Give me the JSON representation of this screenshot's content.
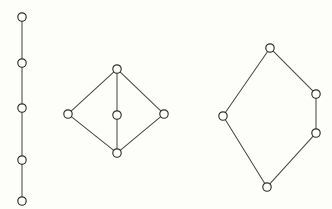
{
  "image": {
    "title": "Three Hasse diagrams of partially ordered sets",
    "background_color": "#fdfdf9",
    "node_fill_color": "#fdfdf9",
    "node_stroke_color": "#2e2e2e",
    "edge_color": "#4a4a4a",
    "width": 332,
    "height": 209,
    "node_radius": 4.2
  },
  "chart_data": {
    "type": "diagram",
    "title": "Three Hasse diagrams of partially ordered sets",
    "xlabel": "",
    "ylabel": "",
    "graphs": [
      {
        "name": "chain-5",
        "label": "Five element chain",
        "nodes": [
          {
            "id": "c1",
            "x": 22,
            "y": 17
          },
          {
            "id": "c2",
            "x": 22,
            "y": 63
          },
          {
            "id": "c3",
            "x": 22,
            "y": 108
          },
          {
            "id": "c4",
            "x": 22,
            "y": 160
          },
          {
            "id": "c5",
            "x": 22,
            "y": 201
          }
        ],
        "edges": [
          {
            "from": "c1",
            "to": "c2"
          },
          {
            "from": "c2",
            "to": "c3"
          },
          {
            "from": "c3",
            "to": "c4"
          },
          {
            "from": "c4",
            "to": "c5"
          }
        ]
      },
      {
        "name": "diamond-m3",
        "label": "Diamond lattice with three atoms",
        "nodes": [
          {
            "id": "d-top",
            "x": 117,
            "y": 69
          },
          {
            "id": "d-left",
            "x": 68,
            "y": 114
          },
          {
            "id": "d-center",
            "x": 117,
            "y": 115
          },
          {
            "id": "d-right",
            "x": 164,
            "y": 114
          },
          {
            "id": "d-bottom",
            "x": 117,
            "y": 153
          }
        ],
        "edges": [
          {
            "from": "d-top",
            "to": "d-left"
          },
          {
            "from": "d-top",
            "to": "d-center"
          },
          {
            "from": "d-top",
            "to": "d-right"
          },
          {
            "from": "d-left",
            "to": "d-bottom"
          },
          {
            "from": "d-center",
            "to": "d-bottom"
          },
          {
            "from": "d-right",
            "to": "d-bottom"
          }
        ]
      },
      {
        "name": "pentagon-n5",
        "label": "Pentagon lattice",
        "nodes": [
          {
            "id": "p-top",
            "x": 270,
            "y": 48
          },
          {
            "id": "p-left",
            "x": 223,
            "y": 116
          },
          {
            "id": "p-upper-right",
            "x": 316,
            "y": 94
          },
          {
            "id": "p-lower-right",
            "x": 316,
            "y": 133
          },
          {
            "id": "p-bottom",
            "x": 267,
            "y": 187
          }
        ],
        "edges": [
          {
            "from": "p-top",
            "to": "p-left"
          },
          {
            "from": "p-top",
            "to": "p-upper-right"
          },
          {
            "from": "p-upper-right",
            "to": "p-lower-right"
          },
          {
            "from": "p-left",
            "to": "p-bottom"
          },
          {
            "from": "p-lower-right",
            "to": "p-bottom"
          }
        ]
      }
    ]
  }
}
